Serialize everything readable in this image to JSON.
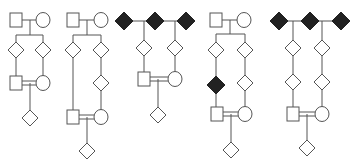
{
  "diagram": {
    "type": "pedigree-charts",
    "count": 5,
    "colors": {
      "line": "#555555",
      "affected": "#222222",
      "unaffected": "#ffffff"
    },
    "pedigrees": [
      {
        "id": "pedigree-1",
        "nodes": [
          {
            "shape": "square",
            "x": 16,
            "y": 20,
            "affected": false
          },
          {
            "shape": "circle",
            "x": 43,
            "y": 20,
            "affected": false
          },
          {
            "shape": "diamond",
            "x": 16,
            "y": 50,
            "affected": false
          },
          {
            "shape": "diamond",
            "x": 43,
            "y": 50,
            "affected": false
          },
          {
            "shape": "square",
            "x": 16,
            "y": 83,
            "affected": false
          },
          {
            "shape": "circle",
            "x": 43,
            "y": 83,
            "affected": false
          },
          {
            "shape": "diamond",
            "x": 30,
            "y": 118,
            "affected": false
          }
        ],
        "lines": [
          [
            22,
            20,
            36,
            20
          ],
          [
            30,
            20,
            30,
            35
          ],
          [
            16,
            35,
            43,
            35
          ],
          [
            16,
            35,
            16,
            42
          ],
          [
            43,
            35,
            43,
            42
          ],
          [
            16,
            58,
            16,
            76
          ],
          [
            43,
            58,
            43,
            76
          ]
        ],
        "consanguineous": [
          22,
          36,
          81,
          85
        ],
        "child_line": [
          30,
          83,
          30,
          110
        ]
      },
      {
        "id": "pedigree-2",
        "nodes": [
          {
            "shape": "square",
            "x": 73,
            "y": 20,
            "affected": false
          },
          {
            "shape": "circle",
            "x": 101,
            "y": 20,
            "affected": false
          },
          {
            "shape": "diamond",
            "x": 73,
            "y": 50,
            "affected": false
          },
          {
            "shape": "diamond",
            "x": 101,
            "y": 50,
            "affected": false
          },
          {
            "shape": "diamond",
            "x": 101,
            "y": 83,
            "affected": false
          },
          {
            "shape": "square",
            "x": 73,
            "y": 117,
            "affected": false
          },
          {
            "shape": "circle",
            "x": 101,
            "y": 117,
            "affected": false
          },
          {
            "shape": "diamond",
            "x": 87,
            "y": 151,
            "affected": false
          }
        ],
        "lines": [
          [
            79,
            20,
            94,
            20
          ],
          [
            87,
            20,
            87,
            35
          ],
          [
            73,
            35,
            101,
            35
          ],
          [
            73,
            35,
            73,
            42
          ],
          [
            101,
            35,
            101,
            42
          ],
          [
            73,
            58,
            73,
            110
          ],
          [
            101,
            58,
            101,
            75
          ],
          [
            101,
            91,
            101,
            110
          ]
        ],
        "consanguineous": [
          79,
          94,
          115,
          119
        ],
        "child_line": [
          87,
          117,
          87,
          143
        ]
      },
      {
        "id": "pedigree-3",
        "nodes": [
          {
            "shape": "diamond",
            "x": 124,
            "y": 21,
            "affected": true
          },
          {
            "shape": "diamond",
            "x": 155,
            "y": 21,
            "affected": true
          },
          {
            "shape": "diamond",
            "x": 186,
            "y": 21,
            "affected": true
          },
          {
            "shape": "diamond",
            "x": 144,
            "y": 48,
            "affected": false
          },
          {
            "shape": "diamond",
            "x": 175,
            "y": 48,
            "affected": false
          },
          {
            "shape": "square",
            "x": 144,
            "y": 79,
            "affected": false
          },
          {
            "shape": "circle",
            "x": 175,
            "y": 79,
            "affected": false
          },
          {
            "shape": "diamond",
            "x": 158,
            "y": 115,
            "affected": false
          }
        ],
        "lines": [
          [
            133,
            21,
            146,
            21
          ],
          [
            164,
            21,
            177,
            21
          ],
          [
            144,
            21,
            144,
            40
          ],
          [
            175,
            21,
            175,
            40
          ],
          [
            144,
            56,
            144,
            72
          ],
          [
            175,
            56,
            175,
            72
          ]
        ],
        "consanguineous": [
          150,
          168,
          77,
          81
        ],
        "child_line": [
          158,
          79,
          158,
          107
        ]
      },
      {
        "id": "pedigree-4",
        "nodes": [
          {
            "shape": "square",
            "x": 216,
            "y": 20,
            "affected": false
          },
          {
            "shape": "circle",
            "x": 244,
            "y": 20,
            "affected": false
          },
          {
            "shape": "diamond",
            "x": 216,
            "y": 50,
            "affected": false
          },
          {
            "shape": "diamond",
            "x": 245,
            "y": 50,
            "affected": false
          },
          {
            "shape": "diamond",
            "x": 216,
            "y": 85,
            "affected": true
          },
          {
            "shape": "diamond",
            "x": 245,
            "y": 83,
            "affected": false
          },
          {
            "shape": "square",
            "x": 217,
            "y": 114,
            "affected": false
          },
          {
            "shape": "circle",
            "x": 245,
            "y": 114,
            "affected": false
          },
          {
            "shape": "diamond",
            "x": 231,
            "y": 150,
            "affected": false
          }
        ],
        "lines": [
          [
            222,
            20,
            237,
            20
          ],
          [
            230,
            20,
            230,
            34
          ],
          [
            216,
            34,
            245,
            34
          ],
          [
            216,
            34,
            216,
            42
          ],
          [
            245,
            34,
            245,
            42
          ],
          [
            216,
            58,
            216,
            77
          ],
          [
            216,
            94,
            216,
            107
          ],
          [
            245,
            58,
            245,
            75
          ],
          [
            245,
            91,
            245,
            107
          ]
        ],
        "consanguineous": [
          223,
          238,
          112,
          116
        ],
        "child_line": [
          231,
          114,
          231,
          142
        ]
      },
      {
        "id": "pedigree-5",
        "nodes": [
          {
            "shape": "diamond",
            "x": 279,
            "y": 21,
            "affected": true
          },
          {
            "shape": "diamond",
            "x": 310,
            "y": 21,
            "affected": true
          },
          {
            "shape": "diamond",
            "x": 341,
            "y": 21,
            "affected": true
          },
          {
            "shape": "diamond",
            "x": 293,
            "y": 48,
            "affected": false
          },
          {
            "shape": "diamond",
            "x": 322,
            "y": 48,
            "affected": false
          },
          {
            "shape": "diamond",
            "x": 293,
            "y": 82,
            "affected": false
          },
          {
            "shape": "diamond",
            "x": 322,
            "y": 82,
            "affected": false
          },
          {
            "shape": "square",
            "x": 293,
            "y": 114,
            "affected": false
          },
          {
            "shape": "circle",
            "x": 322,
            "y": 114,
            "affected": false
          },
          {
            "shape": "diamond",
            "x": 307,
            "y": 148,
            "affected": false
          }
        ],
        "lines": [
          [
            288,
            21,
            301,
            21
          ],
          [
            319,
            21,
            332,
            21
          ],
          [
            293,
            21,
            293,
            40
          ],
          [
            322,
            21,
            322,
            40
          ],
          [
            293,
            56,
            293,
            74
          ],
          [
            322,
            56,
            322,
            74
          ],
          [
            293,
            90,
            293,
            107
          ],
          [
            322,
            90,
            322,
            107
          ]
        ],
        "consanguineous": [
          299,
          315,
          112,
          116
        ],
        "child_line": [
          307,
          114,
          307,
          140
        ]
      }
    ]
  }
}
